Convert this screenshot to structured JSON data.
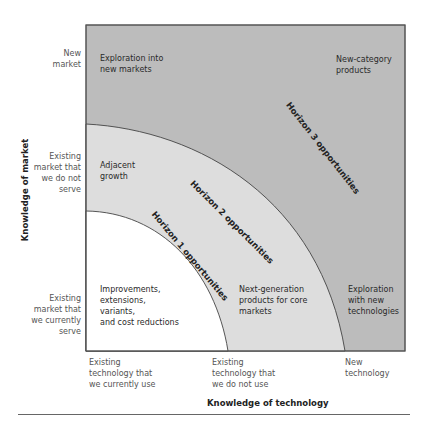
{
  "diagram": {
    "colors": {
      "horizon3": "#bcbcbc",
      "horizon2": "#dddddd",
      "horizon1": "#ffffff",
      "border": "#555555"
    },
    "y_axis": {
      "title": "Knowledge of market",
      "levels": [
        "New\nmarket",
        "Existing\nmarket that\nwe do not\nserve",
        "Existing\nmarket that\nwe currently\nserve"
      ]
    },
    "x_axis": {
      "title": "Knowledge of technology",
      "levels": [
        "Existing\ntechnology that\nwe currently use",
        "Existing\ntechnology that\nwe do not use",
        "New\ntechnology"
      ]
    },
    "horizons": [
      {
        "label": "Horizon 1 opportunities"
      },
      {
        "label": "Horizon 2 opportunities"
      },
      {
        "label": "Horizon 3 opportunities"
      }
    ],
    "cells": {
      "exploration_new_markets": "Exploration into\nnew markets",
      "new_category_products": "New-category\nproducts",
      "adjacent_growth": "Adjacent\ngrowth",
      "improvements": "Improvements,\nextensions,\nvariants,\nand cost reductions",
      "next_generation": "Next-generation\nproducts for core\nmarkets",
      "exploration_new_tech": "Exploration\nwith new\ntechnologies"
    }
  }
}
